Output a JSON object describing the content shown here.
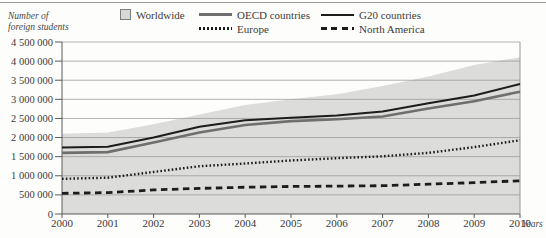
{
  "figure": {
    "y_axis_title_line1": "Number of",
    "y_axis_title_line2": "foreign students",
    "x_axis_title": "Years"
  },
  "colors": {
    "area_fill": "#dcdcda",
    "grid": "#989896",
    "axis": "#5a5a5a",
    "text": "#3b3b3b"
  },
  "chart_data": {
    "type": "area",
    "title": "",
    "xlabel": "Years",
    "ylabel": "Number of foreign students",
    "ylim": [
      0,
      4500000
    ],
    "grid": true,
    "legend_position": "top",
    "x": [
      2000,
      2001,
      2002,
      2003,
      2004,
      2005,
      2006,
      2007,
      2008,
      2009,
      2010
    ],
    "y_ticks": [
      {
        "value": 0,
        "label": "0"
      },
      {
        "value": 500000,
        "label": "500 000"
      },
      {
        "value": 1000000,
        "label": "1 000 000"
      },
      {
        "value": 1500000,
        "label": "1 500 000"
      },
      {
        "value": 2000000,
        "label": "2 000 000"
      },
      {
        "value": 2500000,
        "label": "2 500 000"
      },
      {
        "value": 3000000,
        "label": "3 000 000"
      },
      {
        "value": 3500000,
        "label": "3 500 000"
      },
      {
        "value": 4000000,
        "label": "4 000 000"
      },
      {
        "value": 4500000,
        "label": "4 500 000"
      }
    ],
    "series": [
      {
        "name": "Worldwide",
        "key": "worldwide",
        "type": "area",
        "color": "#dcdcda",
        "values": [
          2100000,
          2130000,
          2350000,
          2600000,
          2850000,
          3000000,
          3130000,
          3350000,
          3600000,
          3900000,
          4100000
        ]
      },
      {
        "name": "OECD countries",
        "key": "oecd",
        "type": "line",
        "color": "#6f6f6f",
        "width": 2.6,
        "dash": "",
        "values": [
          1600000,
          1620000,
          1870000,
          2130000,
          2330000,
          2430000,
          2480000,
          2550000,
          2760000,
          2950000,
          3200000
        ]
      },
      {
        "name": "G20 countries",
        "key": "g20",
        "type": "line",
        "color": "#1c1c1c",
        "width": 2,
        "dash": "",
        "values": [
          1740000,
          1760000,
          2000000,
          2280000,
          2450000,
          2520000,
          2580000,
          2680000,
          2900000,
          3100000,
          3400000
        ]
      },
      {
        "name": "Europe",
        "key": "europe",
        "type": "line",
        "color": "#1c1c1c",
        "width": 2.4,
        "dash": "1.6 2.2",
        "values": [
          920000,
          950000,
          1100000,
          1250000,
          1320000,
          1400000,
          1460000,
          1510000,
          1600000,
          1750000,
          1930000
        ]
      },
      {
        "name": "North America",
        "key": "north_america",
        "type": "line",
        "color": "#1c1c1c",
        "width": 2.8,
        "dash": "6.5 4.5",
        "values": [
          540000,
          560000,
          630000,
          670000,
          700000,
          720000,
          730000,
          740000,
          780000,
          820000,
          870000
        ]
      }
    ]
  }
}
